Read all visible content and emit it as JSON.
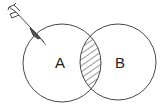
{
  "diagram": {
    "type": "venn",
    "sets": [
      {
        "label": "A",
        "cx": 62,
        "cy": 63,
        "r": 39
      },
      {
        "label": "B",
        "cx": 118,
        "cy": 62,
        "r": 38
      }
    ],
    "highlighted_region": "A ∩ B",
    "decoration": "dart"
  },
  "colors": {
    "stroke": "#333333",
    "hatch": "#333333",
    "background": "#ffffff"
  }
}
